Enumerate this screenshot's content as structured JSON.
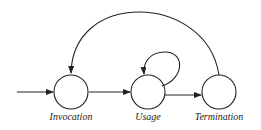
{
  "diagram": {
    "type": "state-diagram",
    "states": [
      {
        "id": "invocation",
        "label": "Invocation"
      },
      {
        "id": "usage",
        "label": "Usage"
      },
      {
        "id": "termination",
        "label": "Termination"
      }
    ],
    "transitions": [
      {
        "from": "start",
        "to": "invocation"
      },
      {
        "from": "invocation",
        "to": "usage"
      },
      {
        "from": "usage",
        "to": "usage"
      },
      {
        "from": "usage",
        "to": "termination"
      },
      {
        "from": "termination",
        "to": "invocation"
      }
    ],
    "stroke_color": "#222222"
  }
}
